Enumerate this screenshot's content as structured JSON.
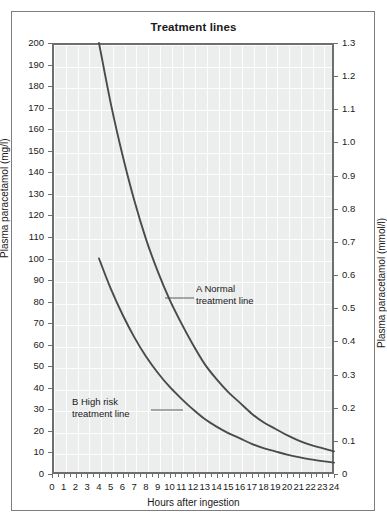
{
  "figure": {
    "title": "Treatment lines",
    "background_color": "#ffffff",
    "plot_background_color": "#eceded",
    "grid_color": "#fdfdfd",
    "axis_color": "#6e6e6e",
    "curve_color": "#4a4a4a",
    "text_color": "#1a1a1a"
  },
  "chart_data": {
    "type": "line",
    "title": "Treatment lines",
    "xlabel": "Hours after ingestion",
    "ylabel": "Plasma paracetamol (mg/l)",
    "ylabel_secondary": "Plasma paracetamol (mmol/l)",
    "xlim": [
      0,
      24
    ],
    "ylim": [
      0,
      200
    ],
    "ylim_secondary": [
      0,
      1.3
    ],
    "grid": true,
    "legend_position": "inline-annotations",
    "xticks": [
      0,
      1,
      2,
      3,
      4,
      5,
      6,
      7,
      8,
      9,
      10,
      11,
      12,
      13,
      14,
      15,
      16,
      17,
      18,
      19,
      20,
      21,
      22,
      23,
      24
    ],
    "xticklabels": [
      "0",
      "1",
      "2",
      "3",
      "4",
      "5",
      "6",
      "7",
      "8",
      "9",
      "10",
      "11",
      "12",
      "13",
      "14",
      "15",
      "16",
      "17",
      "18",
      "19",
      "20",
      "21",
      "22",
      "23",
      "24"
    ],
    "yticks": [
      0,
      10,
      20,
      30,
      40,
      50,
      60,
      70,
      80,
      90,
      100,
      110,
      120,
      130,
      140,
      150,
      160,
      170,
      180,
      190,
      200
    ],
    "yticklabels": [
      "0",
      "10",
      "20",
      "30",
      "40",
      "50",
      "60",
      "70",
      "80",
      "90",
      "100",
      "110",
      "120",
      "130",
      "140",
      "150",
      "160",
      "170",
      "180",
      "190",
      "200"
    ],
    "yticks_secondary": [
      0,
      0.1,
      0.2,
      0.3,
      0.4,
      0.5,
      0.6,
      0.7,
      0.8,
      0.9,
      1.0,
      1.1,
      1.2,
      1.3
    ],
    "yticklabels_secondary": [
      "0",
      "0.1",
      "0.2",
      "0.3",
      "0.4",
      "0.5",
      "0.6",
      "0.7",
      "0.8",
      "0.9",
      "1.0",
      "1.1",
      "1.2",
      "1.3"
    ],
    "series": [
      {
        "name": "A Normal treatment line",
        "label_line1": "A Normal",
        "label_line2": "treatment line",
        "x": [
          4,
          5,
          6,
          7,
          8,
          9,
          10,
          11,
          12,
          13,
          14,
          15,
          16,
          17,
          18,
          19,
          20,
          21,
          22,
          23,
          24
        ],
        "values": [
          200,
          172,
          148,
          127,
          109,
          94,
          81,
          70,
          60,
          51,
          44,
          38,
          33,
          28,
          24,
          21,
          18,
          15.5,
          13.5,
          12,
          10.5
        ]
      },
      {
        "name": "B High risk treatment line",
        "label_line1": "B High risk",
        "label_line2": "treatment line",
        "x": [
          4,
          5,
          6,
          7,
          8,
          9,
          10,
          11,
          12,
          13,
          14,
          15,
          16,
          17,
          18,
          19,
          20,
          21,
          22,
          23,
          24
        ],
        "values": [
          100,
          86,
          74,
          63.5,
          54.5,
          47,
          40.5,
          35,
          30,
          25.5,
          22,
          19,
          16.5,
          14,
          12,
          10.5,
          9,
          7.8,
          6.8,
          6,
          5.3
        ]
      }
    ]
  }
}
